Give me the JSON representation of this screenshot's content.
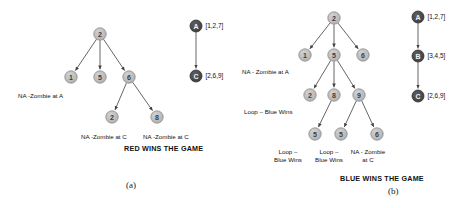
{
  "figure": {
    "background": "#ffffff",
    "node_fill": "#b9b9b9",
    "node_stroke": "#8a8a8a",
    "dark_node_fill": "#4a4a4a",
    "dark_node_stroke": "#2e2e2e",
    "edge_color": "#555555",
    "node_radius": 6.2,
    "dark_node_radius": 6.0
  },
  "panels": [
    {
      "id": "a",
      "letter": "(a)",
      "caption": "RED WINS THE GAME",
      "tree": {
        "nodes": [
          {
            "id": "a-root",
            "label": "2",
            "x": 100,
            "y": 34
          },
          {
            "id": "a-n1",
            "label": "1",
            "x": 71,
            "y": 77
          },
          {
            "id": "a-n5",
            "label": "5",
            "x": 100,
            "y": 77
          },
          {
            "id": "a-n6",
            "label": "6",
            "x": 129,
            "y": 77
          },
          {
            "id": "a-n2b",
            "label": "2",
            "x": 112,
            "y": 117
          },
          {
            "id": "a-n8",
            "label": "8",
            "x": 157,
            "y": 117
          }
        ],
        "edges": [
          {
            "from": "a-root",
            "to": "a-n1"
          },
          {
            "from": "a-root",
            "to": "a-n5"
          },
          {
            "from": "a-root",
            "to": "a-n6"
          },
          {
            "from": "a-n6",
            "to": "a-n2b"
          },
          {
            "from": "a-n6",
            "to": "a-n8"
          }
        ]
      },
      "annotations": [
        {
          "id": "a-ann-1",
          "text": "NA -Zombie at A",
          "x": 18,
          "y": 92,
          "align": "left"
        },
        {
          "id": "a-ann-2",
          "text": "NA -Zombie at C",
          "x": 81,
          "y": 133,
          "align": "left"
        },
        {
          "id": "a-ann-3",
          "text": "NA -Zombie at C",
          "x": 143,
          "y": 133,
          "align": "left"
        }
      ],
      "chain": {
        "nodes": [
          {
            "id": "a-A",
            "label": "A",
            "x": 196,
            "y": 26,
            "values": "[1,2,7]"
          },
          {
            "id": "a-C",
            "label": "C",
            "x": 196,
            "y": 76,
            "values": "[2,6,9]"
          }
        ],
        "edges": [
          {
            "from": "a-A",
            "to": "a-C"
          }
        ]
      },
      "caption_pos": {
        "x": 124,
        "y": 144
      },
      "letter_pos": {
        "x": 126,
        "y": 180
      }
    },
    {
      "id": "b",
      "letter": "(b)",
      "caption": "BLUE WINS THE GAME",
      "tree": {
        "nodes": [
          {
            "id": "b-root",
            "label": "2",
            "x": 334,
            "y": 18
          },
          {
            "id": "b-n1",
            "label": "1",
            "x": 305,
            "y": 55
          },
          {
            "id": "b-n5",
            "label": "5",
            "x": 334,
            "y": 55
          },
          {
            "id": "b-n6",
            "label": "6",
            "x": 363,
            "y": 55
          },
          {
            "id": "b-n2",
            "label": "2",
            "x": 310,
            "y": 95
          },
          {
            "id": "b-n8",
            "label": "8",
            "x": 334,
            "y": 95
          },
          {
            "id": "b-n9",
            "label": "9",
            "x": 359,
            "y": 95
          },
          {
            "id": "b-n5a",
            "label": "5",
            "x": 315,
            "y": 134
          },
          {
            "id": "b-n5b",
            "label": "5",
            "x": 341,
            "y": 134
          },
          {
            "id": "b-n6b",
            "label": "6",
            "x": 377,
            "y": 134
          }
        ],
        "edges": [
          {
            "from": "b-root",
            "to": "b-n1"
          },
          {
            "from": "b-root",
            "to": "b-n5"
          },
          {
            "from": "b-root",
            "to": "b-n6"
          },
          {
            "from": "b-n5",
            "to": "b-n2"
          },
          {
            "from": "b-n5",
            "to": "b-n8"
          },
          {
            "from": "b-n5",
            "to": "b-n9"
          },
          {
            "from": "b-n8",
            "to": "b-n5a"
          },
          {
            "from": "b-n9",
            "to": "b-n5b"
          },
          {
            "from": "b-n9",
            "to": "b-n6b"
          }
        ]
      },
      "annotations": [
        {
          "id": "b-ann-1",
          "text": "NA - Zombie at A",
          "x": 242,
          "y": 68,
          "align": "left"
        },
        {
          "id": "b-ann-2",
          "text": "Loop – Blue Wins",
          "x": 244,
          "y": 108,
          "align": "left"
        },
        {
          "id": "b-ann-3",
          "text": "Loop –\nBlue Wins",
          "x": 288,
          "y": 148,
          "align": "center"
        },
        {
          "id": "b-ann-4",
          "text": "Loop –\nBlue Wins",
          "x": 329,
          "y": 148,
          "align": "center"
        },
        {
          "id": "b-ann-5",
          "text": "NA - Zombie\nat C",
          "x": 368,
          "y": 148,
          "align": "center"
        }
      ],
      "chain": {
        "nodes": [
          {
            "id": "b-A",
            "label": "A",
            "x": 418,
            "y": 17,
            "values": "[1,2,7]"
          },
          {
            "id": "b-B",
            "label": "B",
            "x": 418,
            "y": 56,
            "values": "[3,4,5]"
          },
          {
            "id": "b-C",
            "label": "C",
            "x": 418,
            "y": 96,
            "values": "[2,6,9]"
          }
        ],
        "edges": [
          {
            "from": "b-A",
            "to": "b-B"
          },
          {
            "from": "b-B",
            "to": "b-C"
          }
        ]
      },
      "caption_pos": {
        "x": 340,
        "y": 174
      },
      "letter_pos": {
        "x": 388,
        "y": 186
      }
    }
  ]
}
